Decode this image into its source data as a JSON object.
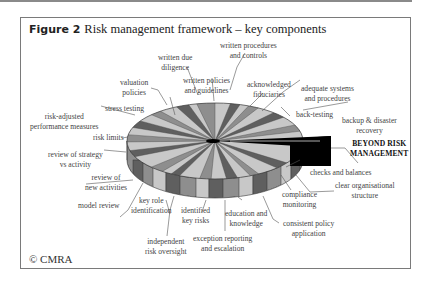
{
  "figure": {
    "label": "Figure 2",
    "title": "Risk management framework – key components",
    "copyright": "© CMRA"
  },
  "diagram": {
    "type": "3d-pie",
    "highlight": "BEYOND RISK MANAGEMENT",
    "colors": {
      "light": "#c8c8c8",
      "mid": "#8e8e8e",
      "dark": "#5f5f5f",
      "highlight": "#000000"
    },
    "labels": {
      "written_due_diligence": [
        "written due",
        "diligence"
      ],
      "written_procedures": [
        "written procedures",
        "and controls"
      ],
      "valuation_policies": [
        "valuation",
        "policies"
      ],
      "written_policies": [
        "written policies",
        "and guidelines"
      ],
      "acknowledged_fiduciaries": [
        "acknowledged",
        "fiduciaries"
      ],
      "adequate_systems": [
        "adequate systems",
        "and procedures"
      ],
      "stress_testing": [
        "stress testing"
      ],
      "back_testing": [
        "back-testing"
      ],
      "risk_adjusted": [
        "risk-adjusted",
        "performance measures"
      ],
      "backup_recovery": [
        "backup & disaster",
        "recovery"
      ],
      "risk_limits": [
        "risk limits"
      ],
      "beyond": [
        "BEYOND RISK",
        "MANAGEMENT"
      ],
      "review_strategy": [
        "review of strategy",
        "vs activity"
      ],
      "checks_balances": [
        "checks and balances"
      ],
      "review_new": [
        "review of",
        "new activities"
      ],
      "clear_org": [
        "clear organisational",
        "structure"
      ],
      "compliance": [
        "compliance",
        "monitoring"
      ],
      "model_review": [
        "model review"
      ],
      "key_role": [
        "key role",
        "identification"
      ],
      "identified_risks": [
        "identified",
        "key risks"
      ],
      "education": [
        "education and",
        "knowledge"
      ],
      "consistent_policy": [
        "consistent policy",
        "application"
      ],
      "independent_oversight": [
        "independent",
        "risk oversight"
      ],
      "exception_reporting": [
        "exception reporting",
        "and escalation"
      ]
    }
  }
}
